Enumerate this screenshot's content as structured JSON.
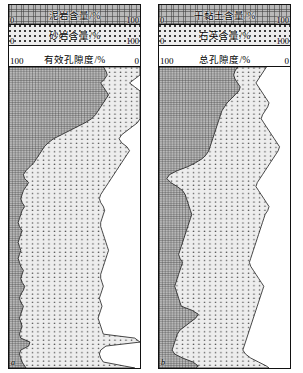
{
  "figure": {
    "type": "well-log-stacked-area",
    "panels": [
      {
        "id": "a",
        "corner_label": "a",
        "legend": [
          {
            "name": "mudstone-content",
            "title": "泥岩含量/%",
            "min": "0",
            "max": "100",
            "pattern": "hatch"
          },
          {
            "name": "sandstone-content",
            "title": "砂岩含量/%",
            "min": "0",
            "max": "100",
            "pattern": "dots"
          },
          {
            "name": "effective-porosity",
            "title": "有效孔隙度/%",
            "min": "100",
            "max": "0",
            "pattern": "white"
          }
        ]
      },
      {
        "id": "b",
        "corner_label": "b",
        "legend": [
          {
            "name": "dry-clay-content",
            "title": "干黏土含量/%",
            "min": "0",
            "max": "100",
            "pattern": "hatch"
          },
          {
            "name": "quartz-content",
            "title": "石英含量/%",
            "min": "0",
            "max": "100",
            "pattern": "dots"
          },
          {
            "name": "total-porosity",
            "title": "总孔隙度/%",
            "min": "100",
            "max": "0",
            "pattern": "white"
          }
        ]
      }
    ]
  },
  "chart_data": [
    {
      "type": "area",
      "id": "panel-a",
      "title": "有效孔隙度/%",
      "xlabel": "含量/%",
      "ylabel": "深度",
      "xlim": [
        0,
        100
      ],
      "ylim": [
        0,
        302
      ],
      "grid": false,
      "legend_position": "top",
      "note": "cumulative stacked fractions; boundary1 = mudstone share, boundary2 = mudstone+sandstone share, remainder to 100 = effective porosity",
      "series": [
        {
          "name": "泥岩含量/%",
          "pattern": "hatch"
        },
        {
          "name": "砂岩含量/%",
          "pattern": "dots"
        },
        {
          "name": "有效孔隙度/%",
          "pattern": "white"
        }
      ],
      "depth": [
        0,
        4,
        8,
        12,
        16,
        20,
        24,
        28,
        32,
        36,
        40,
        44,
        48,
        52,
        56,
        60,
        64,
        68,
        72,
        76,
        80,
        84,
        88,
        92,
        96,
        100,
        104,
        108,
        112,
        116,
        120,
        124,
        128,
        132,
        136,
        140,
        144,
        148,
        152,
        156,
        160,
        164,
        168,
        172,
        176,
        180,
        184,
        188,
        192,
        196,
        200,
        204,
        208,
        212,
        216,
        220,
        224,
        228,
        232,
        236,
        240,
        244,
        248,
        252,
        256,
        260,
        264,
        268,
        272,
        276,
        280,
        284,
        288,
        292,
        296,
        300,
        302
      ],
      "boundary1": [
        72,
        74,
        75,
        73,
        70,
        72,
        74,
        76,
        74,
        72,
        70,
        68,
        66,
        63,
        58,
        52,
        46,
        40,
        34,
        30,
        27,
        25,
        23,
        21,
        19,
        16,
        13,
        11,
        12,
        15,
        13,
        11,
        10,
        9,
        10,
        12,
        10,
        9,
        8,
        7,
        8,
        10,
        9,
        8,
        7,
        8,
        9,
        8,
        7,
        8,
        9,
        11,
        10,
        9,
        10,
        12,
        11,
        9,
        8,
        9,
        11,
        10,
        9,
        8,
        9,
        10,
        9,
        8,
        9,
        16,
        15,
        9,
        8,
        9,
        10,
        12,
        13
      ],
      "boundary2": [
        100,
        100,
        100,
        96,
        92,
        96,
        100,
        100,
        100,
        100,
        100,
        100,
        100,
        100,
        98,
        94,
        90,
        86,
        84,
        86,
        90,
        92,
        90,
        88,
        86,
        84,
        82,
        80,
        78,
        76,
        74,
        72,
        70,
        69,
        70,
        72,
        73,
        72,
        71,
        70,
        70,
        71,
        72,
        73,
        74,
        75,
        76,
        75,
        74,
        73,
        72,
        71,
        70,
        70,
        71,
        72,
        71,
        70,
        69,
        70,
        71,
        70,
        69,
        68,
        69,
        70,
        71,
        72,
        96,
        100,
        74,
        70,
        69,
        70,
        72,
        88,
        96
      ]
    },
    {
      "type": "area",
      "id": "panel-b",
      "title": "总孔隙度/%",
      "xlabel": "含量/%",
      "ylabel": "深度",
      "xlim": [
        0,
        100
      ],
      "ylim": [
        0,
        302
      ],
      "grid": false,
      "legend_position": "top",
      "note": "cumulative stacked fractions; boundary1 = dry-clay share, boundary2 = dry-clay+quartz share, remainder to 100 = total porosity",
      "series": [
        {
          "name": "干黏土含量/%",
          "pattern": "hatch"
        },
        {
          "name": "石英含量/%",
          "pattern": "dots"
        },
        {
          "name": "总孔隙度/%",
          "pattern": "white"
        }
      ],
      "depth": [
        0,
        4,
        8,
        12,
        16,
        20,
        24,
        28,
        32,
        36,
        40,
        44,
        48,
        52,
        56,
        60,
        64,
        68,
        72,
        76,
        80,
        84,
        88,
        92,
        96,
        100,
        104,
        108,
        112,
        116,
        120,
        124,
        128,
        132,
        136,
        140,
        144,
        148,
        152,
        156,
        160,
        164,
        168,
        172,
        176,
        180,
        184,
        188,
        192,
        196,
        200,
        204,
        208,
        212,
        216,
        220,
        224,
        228,
        232,
        236,
        240,
        244,
        248,
        252,
        256,
        260,
        264,
        268,
        272,
        276,
        280,
        284,
        288,
        292,
        296,
        300,
        302
      ],
      "boundary1": [
        60,
        58,
        57,
        58,
        60,
        62,
        61,
        58,
        55,
        52,
        50,
        48,
        47,
        46,
        45,
        44,
        43,
        42,
        41,
        40,
        39,
        38,
        36,
        33,
        28,
        22,
        14,
        8,
        6,
        9,
        14,
        18,
        20,
        21,
        22,
        23,
        24,
        25,
        24,
        23,
        22,
        21,
        20,
        19,
        18,
        17,
        16,
        15,
        16,
        18,
        17,
        16,
        15,
        14,
        13,
        12,
        13,
        14,
        15,
        16,
        17,
        25,
        30,
        28,
        24,
        20,
        16,
        14,
        13,
        12,
        11,
        10,
        12,
        18,
        26,
        30,
        28
      ],
      "boundary2": [
        82,
        80,
        78,
        76,
        74,
        76,
        78,
        80,
        82,
        84,
        83,
        81,
        79,
        78,
        80,
        82,
        84,
        86,
        88,
        90,
        92,
        91,
        89,
        87,
        85,
        83,
        81,
        79,
        77,
        75,
        74,
        76,
        78,
        80,
        82,
        84,
        83,
        81,
        80,
        79,
        78,
        77,
        76,
        75,
        74,
        73,
        72,
        71,
        70,
        69,
        70,
        72,
        74,
        76,
        78,
        80,
        79,
        78,
        77,
        76,
        75,
        74,
        73,
        72,
        71,
        70,
        69,
        68,
        67,
        66,
        65,
        64,
        66,
        70,
        76,
        82,
        84
      ]
    }
  ]
}
